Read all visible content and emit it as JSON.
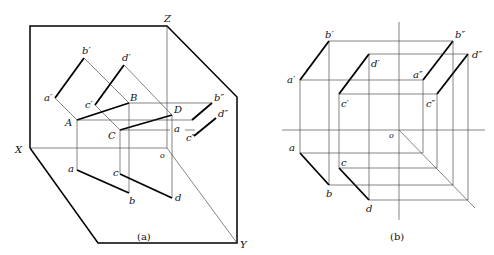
{
  "figure_a": {
    "caption": "(a)",
    "axes": {
      "x": "X",
      "y": "Y",
      "z": "Z",
      "origin": "o"
    },
    "points_3d": [
      "A",
      "B",
      "C",
      "D"
    ],
    "front_projection": [
      "a′",
      "b′",
      "c′",
      "d′"
    ],
    "top_projection": [
      "a",
      "b",
      "c",
      "d"
    ],
    "side_projection": [
      "b″",
      "d″",
      "c″",
      "a"
    ]
  },
  "figure_b": {
    "caption": "(b)",
    "origin": "o",
    "front_projection": [
      "a′",
      "b′",
      "c′",
      "d′"
    ],
    "side_projection": [
      "a″",
      "b″",
      "c″",
      "d″"
    ],
    "top_projection": [
      "a",
      "b",
      "c",
      "d"
    ]
  }
}
